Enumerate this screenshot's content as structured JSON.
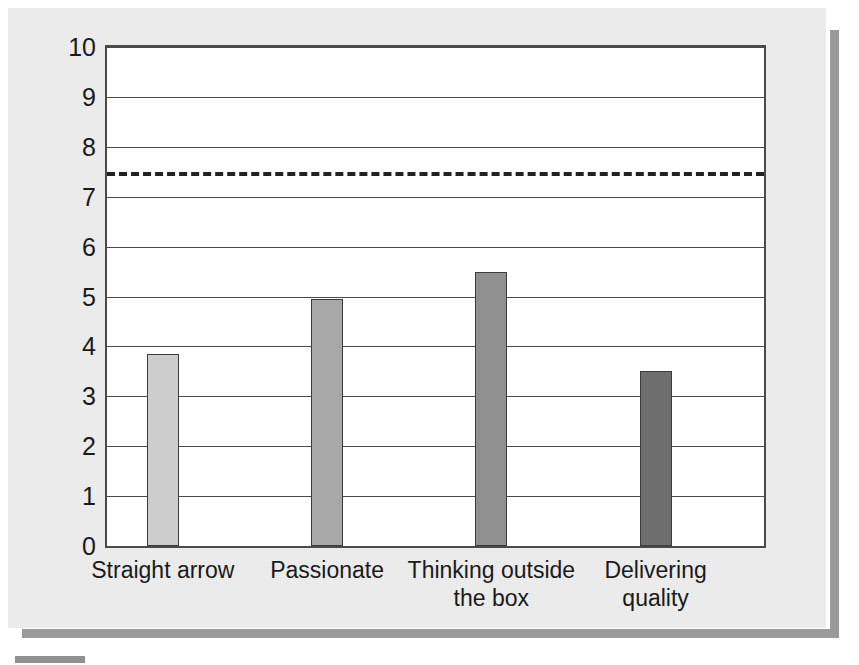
{
  "chart_data": {
    "type": "bar",
    "title": "",
    "subtitle": "",
    "xlabel": "",
    "ylabel": "",
    "categories": [
      "Straight arrow",
      "Passionate",
      "Thinking outside\nthe box",
      "Delivering\nquality"
    ],
    "values": [
      3.85,
      4.95,
      5.5,
      3.5
    ],
    "series": [
      {
        "name": "Rating",
        "values": [
          3.85,
          4.95,
          5.5,
          3.5
        ]
      }
    ],
    "bar_colors": [
      "#cdcdcd",
      "#a8a8a8",
      "#909090",
      "#6e6e6e"
    ],
    "ylim": [
      0,
      10
    ],
    "ytick_labels": [
      "10",
      "9",
      "8",
      "7",
      "6",
      "5",
      "4",
      "3",
      "2",
      "1",
      "0"
    ],
    "ytick_values": [
      10,
      9,
      8,
      7,
      6,
      5,
      4,
      3,
      2,
      1,
      0
    ],
    "grid": true,
    "grid_axis": "y",
    "legend": false,
    "legend_position": "none",
    "annotations": [
      {
        "type": "reference-line",
        "label": "",
        "value": 7.5,
        "style": "dashed",
        "color": "#222222"
      }
    ]
  },
  "figure": {
    "background_color": "#eeeeee",
    "plot_background_color": "#ffffff",
    "axis_color": "#4a4a4a"
  }
}
